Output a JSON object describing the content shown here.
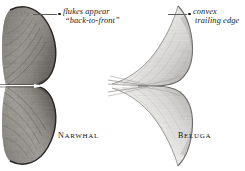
{
  "plate": {
    "background_color": "#ffffff",
    "ink_color": "#1a1a1a",
    "leader_color": "#5d5d5d"
  },
  "figures": [
    {
      "id": "narwhal",
      "species_caption": "Narwhal",
      "tone": "dark mottled",
      "callout": {
        "line1": "flukes appear",
        "line2": "“back-to-front”"
      }
    },
    {
      "id": "beluga",
      "species_caption": "Beluga",
      "tone": "pale line-shaded",
      "callout": {
        "line1": "convex",
        "line2": "trailing edge"
      }
    }
  ]
}
